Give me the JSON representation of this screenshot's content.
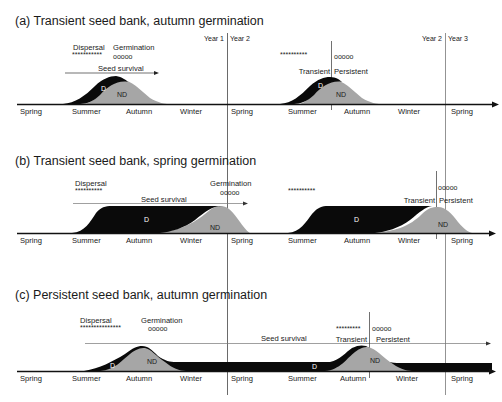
{
  "figure": {
    "year_lines": [
      {
        "left": "Year 1",
        "right": "Year 2",
        "x": 227
      },
      {
        "left": "Year 2",
        "right": "Year 3",
        "x": 445
      }
    ],
    "seasons": [
      "Spring",
      "Summer",
      "Autumn",
      "Winter",
      "Spring",
      "Summer",
      "Autumn",
      "Winter",
      "Spring"
    ],
    "colors": {
      "dormant": "#0a0a0a",
      "non_dormant": "#a6a6a6",
      "axis": "#111111",
      "line": "#555555"
    }
  },
  "panels": [
    {
      "title": "(a) Transient seed bank, autumn germination",
      "dispersal_label": "Dispersal",
      "dispersal_mark": "***********",
      "germination_label": "Germination",
      "germination_mark": "ooooo",
      "survival_label": "Seed survival",
      "year2_dispersal_mark": "**********",
      "year2_germination_mark": "ooooo",
      "transient_label": "Transient",
      "persistent_label": "Persistent",
      "d_label": "D",
      "nd_label": "ND",
      "d_label_2": "D",
      "nd_label_2": "ND"
    },
    {
      "title": "(b) Transient seed bank, spring germination",
      "dispersal_label": "Dispersal",
      "dispersal_mark": "**********",
      "germination_label": "Germination",
      "germination_mark": "ooooo",
      "survival_label": "Seed survival",
      "year2_dispersal_mark": "**********",
      "year2_germination_mark": "ooooo",
      "transient_label": "Transient",
      "persistent_label": "Persistent",
      "d_label": "D",
      "nd_label": "ND",
      "d_label_2": "D",
      "nd_label_2": "ND"
    },
    {
      "title": "(c) Persistent seed bank, autumn germination",
      "dispersal_label": "Dispersal",
      "dispersal_mark": "***************",
      "germination_label": "Germination",
      "germination_mark": "ooooo",
      "survival_label": "Seed survival",
      "year2_dispersal_mark": "*********",
      "year2_germination_mark": "ooooo",
      "transient_label": "Transient",
      "persistent_label": "Persistent",
      "d_label": "D",
      "nd_label": "ND",
      "d_label_2": "D",
      "nd_label_2": "ND"
    }
  ]
}
